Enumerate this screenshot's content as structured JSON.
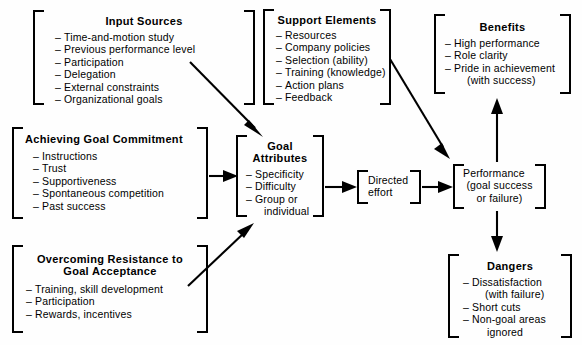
{
  "diagram": {
    "background_color": "#fefefe",
    "line_color": "#000000"
  },
  "nodes": {
    "input_sources": {
      "title": "Input Sources",
      "items": [
        "Time-and-motion study",
        "Previous performance level",
        "Participation",
        "Delegation",
        "External constraints",
        "Organizational goals"
      ]
    },
    "achieving_goal_commitment": {
      "title": "Achieving Goal Commitment",
      "items": [
        "Instructions",
        "Trust",
        "Supportiveness",
        "Spontaneous competition",
        "Past success"
      ]
    },
    "overcoming_resistance": {
      "title_line1": "Overcoming Resistance to",
      "title_line2": "Goal Acceptance",
      "items": [
        "Training, skill development",
        "Participation",
        "Rewards, incentives"
      ]
    },
    "support_elements": {
      "title": "Support Elements",
      "items": [
        "Resources",
        "Company policies",
        "Selection (ability)",
        "Training (knowledge)",
        "Action plans",
        "Feedback"
      ]
    },
    "goal_attributes": {
      "title_line1": "Goal",
      "title_line2": "Attributes",
      "items": [
        "Specificity",
        "Difficulty",
        "Group or"
      ],
      "item_continuation": "individual"
    },
    "directed_effort": {
      "line1": "Directed",
      "line2": "effort"
    },
    "performance": {
      "line1": "Performance",
      "line2": "(goal success",
      "line3": "or failure)"
    },
    "benefits": {
      "title": "Benefits",
      "items": [
        "High performance",
        "Role clarity",
        "Pride in achievement"
      ],
      "item_continuation": "(with success)"
    },
    "dangers": {
      "title": "Dangers",
      "items": [
        "Dissatisfaction",
        "Short cuts",
        "Non-goal areas"
      ],
      "item1_continuation": "(with failure)",
      "item3_continuation": "ignored"
    }
  },
  "connections": [
    {
      "name": "input-sources-to-goal-attributes",
      "from": "input_sources",
      "to": "goal_attributes",
      "style": "diagonal-down-right"
    },
    {
      "name": "achieving-commitment-to-goal-attributes",
      "from": "achieving_goal_commitment",
      "to": "goal_attributes",
      "style": "horizontal-right"
    },
    {
      "name": "overcoming-resistance-to-goal-attributes",
      "from": "overcoming_resistance",
      "to": "goal_attributes",
      "style": "diagonal-up-right"
    },
    {
      "name": "support-elements-to-performance",
      "from": "support_elements",
      "to": "performance",
      "style": "diagonal-down-right"
    },
    {
      "name": "goal-attributes-to-directed-effort",
      "from": "goal_attributes",
      "to": "directed_effort",
      "style": "horizontal-right"
    },
    {
      "name": "directed-effort-to-performance",
      "from": "directed_effort",
      "to": "performance",
      "style": "horizontal-right"
    },
    {
      "name": "performance-to-benefits",
      "from": "performance",
      "to": "benefits",
      "style": "vertical-up"
    },
    {
      "name": "performance-to-dangers",
      "from": "performance",
      "to": "dangers",
      "style": "vertical-down"
    }
  ]
}
